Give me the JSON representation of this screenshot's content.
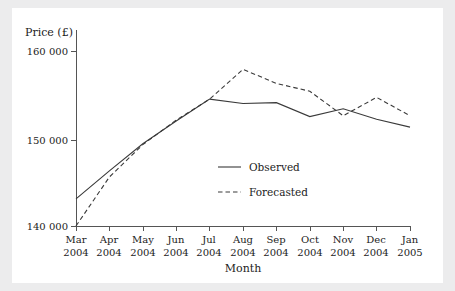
{
  "chart_data": {
    "type": "line",
    "title": "",
    "xlabel": "Month",
    "ylabel": "Price (£)",
    "categories": [
      "Mar 2004",
      "Apr 2004",
      "May 2004",
      "Jun 2004",
      "Jul 2004",
      "Aug 2004",
      "Sep 2004",
      "Oct 2004",
      "Nov 2004",
      "Dec 2004",
      "Jan 2005"
    ],
    "category_lines": [
      [
        "Mar",
        "2004"
      ],
      [
        "Apr",
        "2004"
      ],
      [
        "May",
        "2004"
      ],
      [
        "Jun",
        "2004"
      ],
      [
        "Jul",
        "2004"
      ],
      [
        "Aug",
        "2004"
      ],
      [
        "Sep",
        "2004"
      ],
      [
        "Oct",
        "2004"
      ],
      [
        "Nov",
        "2004"
      ],
      [
        "Dec",
        "2004"
      ],
      [
        "Jan",
        "2005"
      ]
    ],
    "series": [
      {
        "name": "Observed",
        "style": "solid",
        "color": "#3a3a3a",
        "values": [
          143100,
          146300,
          149400,
          152000,
          154500,
          154000,
          154100,
          152500,
          153400,
          152200,
          151300
        ]
      },
      {
        "name": "Forecasted",
        "style": "dashed",
        "color": "#3a3a3a",
        "values": [
          140000,
          145600,
          149300,
          152100,
          154500,
          157900,
          156300,
          155400,
          152600,
          154700,
          152600
        ]
      }
    ],
    "ylim": [
      140000,
      160000
    ],
    "yticks": [
      140000,
      150000,
      160000
    ],
    "ytick_labels": [
      "140 000",
      "150 000",
      "160 000"
    ],
    "grid": false,
    "legend_position": "center",
    "legend_entries": [
      {
        "label": "Observed",
        "style": "solid"
      },
      {
        "label": "Forecasted",
        "style": "dashed"
      }
    ]
  },
  "figure": {
    "background": "#ececed",
    "plot_background": "#ffffff",
    "axis_color": "#555555"
  }
}
